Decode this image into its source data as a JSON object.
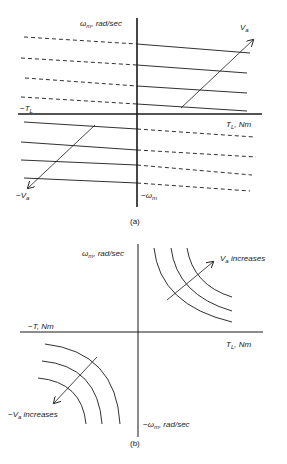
{
  "figure_a": {
    "caption": "(a)",
    "y_axis_label_main": "ω",
    "y_axis_label_sub": "m",
    "y_axis_label_rest": ", rad/sec",
    "x_axis_label_main": "T",
    "x_axis_label_sub": "L",
    "x_axis_label_rest": ", Nm",
    "neg_x_label_main": "−T",
    "neg_x_label_sub": "L",
    "neg_y_label_main": "−ω",
    "neg_y_label_sub": "m",
    "arrow_pos_label_main": "V",
    "arrow_pos_label_sub": "a",
    "arrow_neg_label_main": "−V",
    "arrow_neg_label_sub": "a"
  },
  "figure_b": {
    "caption": "(b)",
    "y_axis_label_main": "ω",
    "y_axis_label_sub": "m",
    "y_axis_label_rest": ", rad/sec",
    "x_axis_label_main": "T",
    "x_axis_label_sub": "L",
    "x_axis_label_rest": ", Nm",
    "neg_x_label": "−T, Nm",
    "neg_y_label_main": "−ω",
    "neg_y_label_sub": "m",
    "neg_y_label_rest": ", rad/sec",
    "arrow_pos_label_main": "V",
    "arrow_pos_label_sub": "a",
    "arrow_pos_label_rest": " increases",
    "arrow_neg_label_main": "−V",
    "arrow_neg_label_sub": "a",
    "arrow_neg_label_rest": " increases"
  },
  "colors": {
    "line": "#1a1a1a",
    "background": "#ffffff"
  }
}
